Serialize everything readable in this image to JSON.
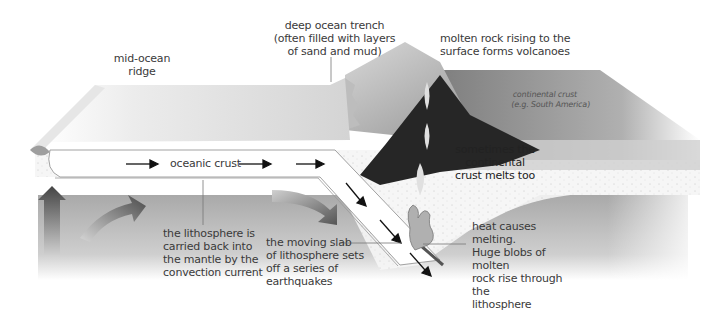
{
  "diagram": {
    "type": "cross-section",
    "colors": {
      "background": "#ffffff",
      "oceanic_plate_top": "#d9d9d9",
      "lithosphere_slab": "#ffffff",
      "mantle": "#b5b5b5",
      "dark_magma_zone": "#2b2b2b",
      "continental_crust": "#9a9a9a",
      "arrow": "#111111",
      "convection_arrow": "#5a5a5a",
      "magma_blob": "#a8a8a8",
      "text": "#3a3a3a"
    }
  },
  "labels": {
    "mid_ocean_ridge": "mid-ocean\nridge",
    "trench": "deep ocean trench\n(often filled with layers\nof sand and mud)",
    "volcanoes": "molten rock rising to the\nsurface forms volcanoes",
    "continental_crust": "continental crust\n(e.g. South America)",
    "oceanic_crust": "oceanic crust",
    "continental_melt": "sometimes the continental\ncrust melts too",
    "lithosphere_carried": "the lithosphere is\ncarried back into\nthe mantle by the\nconvection current",
    "moving_slab": "the moving slab\nof lithosphere sets\noff a series of\nearthquakes",
    "heat_melting": "heat causes melting.\nHuge blobs of molten\nrock rise through the\nlithosphere"
  },
  "arrows": {
    "plate_motion": [
      "right",
      "right",
      "right",
      "down-right",
      "down-right",
      "down-right"
    ],
    "convection": [
      "up",
      "curved-right",
      "curved-down"
    ]
  }
}
